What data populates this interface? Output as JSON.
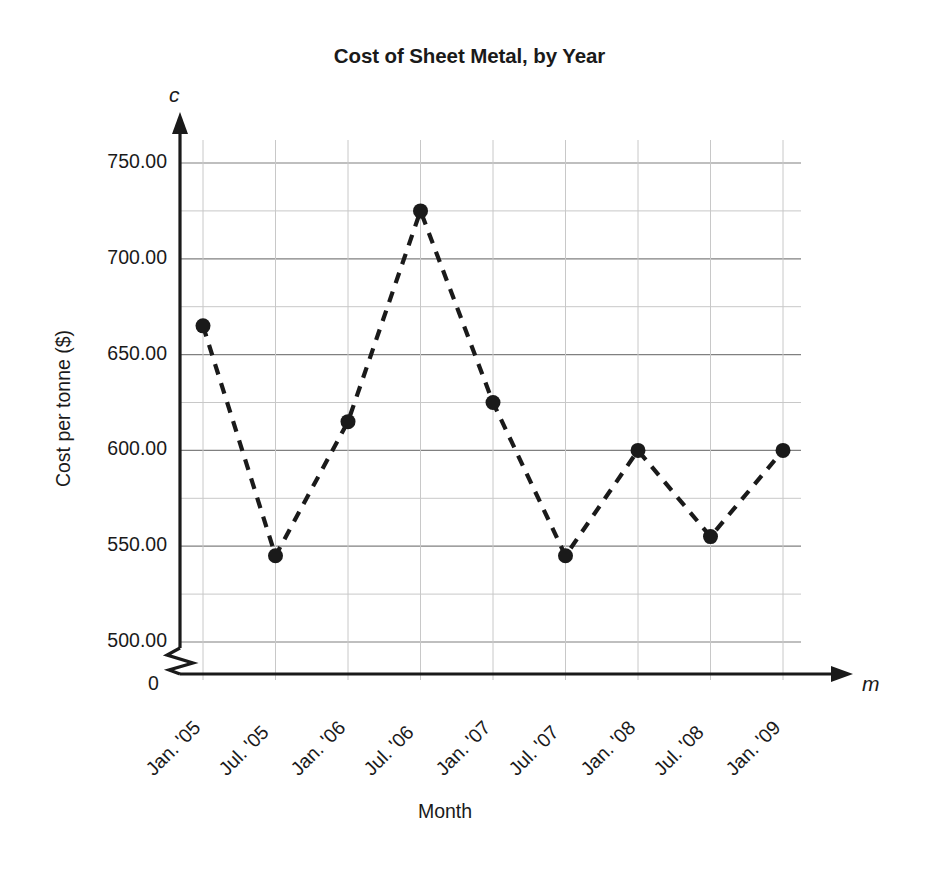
{
  "chart_data": {
    "type": "line",
    "title": "Cost of Sheet Metal, by Year",
    "xlabel": "Month",
    "ylabel": "Cost per tonne ($)",
    "x_axis_variable": "m",
    "y_axis_variable": "c",
    "categories": [
      "Jan. '05",
      "Jul. '05",
      "Jan. '06",
      "Jul. '06",
      "Jan. '07",
      "Jul. '07",
      "Jan. '08",
      "Jul. '08",
      "Jan. '09"
    ],
    "values": [
      665,
      545,
      615,
      725,
      625,
      545,
      600,
      555,
      600
    ],
    "series": [
      {
        "name": "Cost per tonne",
        "values": [
          665,
          545,
          615,
          725,
          625,
          545,
          600,
          555,
          600
        ]
      }
    ],
    "ylim": [
      487.5,
      762.5
    ],
    "ymajor_ticks": [
      500,
      550,
      600,
      650,
      700,
      750
    ],
    "ytick_labels": [
      "500.00",
      "550.00",
      "600.00",
      "650.00",
      "700.00",
      "750.00"
    ],
    "yminor_ticks": [
      512.5,
      525,
      575,
      625,
      675,
      725,
      750
    ],
    "yminor_gridline_values": [
      525,
      575,
      625,
      675,
      725
    ],
    "y_axis_break": true,
    "y_axis_break_label": "0",
    "grid": true,
    "grid_major_color": "#808080",
    "grid_minor_color": "#c8c8c8",
    "legend": "none",
    "line_style": "dashed",
    "line_color": "#1a1a1a",
    "marker": "circle",
    "marker_color": "#1a1a1a",
    "marker_size": 15,
    "axis_color": "#1a1a1a",
    "background_color": "#ffffff",
    "xtick_label_rotation": -45
  }
}
